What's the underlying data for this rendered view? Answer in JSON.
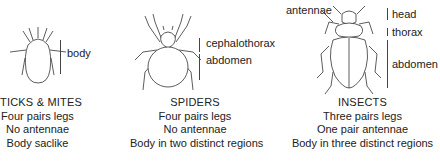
{
  "figure": {
    "panels": [
      {
        "id": "ticks-mites",
        "illustration": "mite-icon",
        "parts": [
          {
            "label": "body"
          }
        ],
        "title": "TICKS & MITES",
        "lines": [
          "Four pairs legs",
          "No antennae",
          "Body saclike"
        ]
      },
      {
        "id": "spiders",
        "illustration": "spider-icon",
        "parts": [
          {
            "label": "cephalothorax"
          },
          {
            "label": "abdomen"
          }
        ],
        "title": "SPIDERS",
        "lines": [
          "Four pairs legs",
          "No antennae",
          "Body in two distinct regions"
        ]
      },
      {
        "id": "insects",
        "illustration": "beetle-icon",
        "antenna_label": "antennae",
        "parts": [
          {
            "label": "head"
          },
          {
            "label": "thorax"
          },
          {
            "label": "abdomen"
          }
        ],
        "title": "INSECTS",
        "lines": [
          "Three pairs legs",
          "One pair antennae",
          "Body in three distinct regions"
        ]
      }
    ]
  }
}
